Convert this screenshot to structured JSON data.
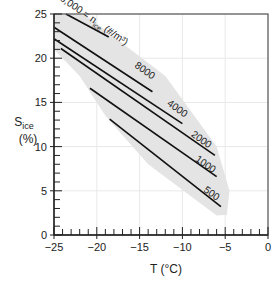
{
  "chart_data": {
    "type": "line",
    "title": "",
    "xlabel": "T (°C)",
    "ylabel_main": "S",
    "ylabel_sub": "ice",
    "ylabel_unit": "(%)",
    "xlim": [
      -25,
      0
    ],
    "ylim": [
      0,
      25
    ],
    "x_ticks": [
      -25,
      -20,
      -15,
      -10,
      -5,
      0
    ],
    "x_tick_labels": [
      "−25",
      "−20",
      "−15",
      "−10",
      "−5",
      "0"
    ],
    "y_ticks": [
      0,
      5,
      10,
      15,
      20,
      25
    ],
    "y_tick_labels": [
      "0",
      "5",
      "10",
      "15",
      "20",
      "25"
    ],
    "grid": true,
    "legend": "none",
    "shaded_region": {
      "description": "observed domain (gray band)",
      "color": "#e6e6e6",
      "polygon": [
        [
          -25,
          25
        ],
        [
          -21.5,
          25
        ],
        [
          -12,
          18
        ],
        [
          -6,
          10
        ],
        [
          -4.5,
          5
        ],
        [
          -4.8,
          2.3
        ],
        [
          -6,
          2.2
        ],
        [
          -14,
          8
        ],
        [
          -19,
          13.5
        ],
        [
          -22,
          18
        ],
        [
          -25,
          21
        ]
      ]
    },
    "curve_label": "n_ice (#/m³)",
    "series": [
      {
        "name": "16,000",
        "x": [
          -23.6,
          -18.6
        ],
        "y": [
          25,
          22.4
        ]
      },
      {
        "name": "8000",
        "x": [
          -25,
          -13.5
        ],
        "y": [
          23.5,
          16.2
        ]
      },
      {
        "name": "4000",
        "x": [
          -25,
          -10
        ],
        "y": [
          22.2,
          12.6
        ]
      },
      {
        "name": "2000",
        "x": [
          -24.2,
          -6.2
        ],
        "y": [
          21.1,
          9.0
        ]
      },
      {
        "name": "1000",
        "x": [
          -20.8,
          -6.0
        ],
        "y": [
          16.6,
          6.6
        ]
      },
      {
        "name": "500",
        "x": [
          -18.5,
          -5.5
        ],
        "y": [
          13.1,
          3.2
        ]
      }
    ],
    "annotations": [
      {
        "text": "16,000 = n",
        "sub": "ice",
        "tail": " (#/m³)",
        "x": -20.8,
        "y": 24.2
      },
      {
        "text": "8000",
        "x": -14.6,
        "y": 18.3
      },
      {
        "text": "4000",
        "x": -10.8,
        "y": 14.0
      },
      {
        "text": "2000",
        "x": -8.0,
        "y": 10.5
      },
      {
        "text": "1000",
        "x": -7.5,
        "y": 7.7
      },
      {
        "text": "500",
        "x": -6.8,
        "y": 4.4
      }
    ]
  }
}
